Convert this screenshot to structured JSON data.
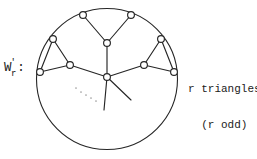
{
  "figure": {
    "name": "W-prime-r-wheel-graph",
    "left_label": {
      "base": "W",
      "prime": "'",
      "subscript": "r",
      "colon": ":"
    },
    "right_label": {
      "line1": "r triangles",
      "line2": "(r odd)"
    },
    "ellipsis": "...",
    "colors": {
      "ink": "#1b1b1b",
      "stroke": "#262626",
      "node_fill": "#ffffff",
      "background": "#ffffff",
      "faint_ink": "#9a9a9a"
    },
    "geometry": {
      "circle": {
        "cx": 107,
        "cy": 79,
        "r": 70.5
      },
      "hub": {
        "x": 107,
        "y": 77
      },
      "stroke_width": 1.1,
      "node_radius": 3.4
    },
    "nodes": [
      {
        "id": "rim-top-left",
        "x": 83,
        "y": 15,
        "on_circle": true
      },
      {
        "id": "rim-top-right",
        "x": 131,
        "y": 15,
        "on_circle": true
      },
      {
        "id": "rim-upper-left",
        "x": 53,
        "y": 39,
        "on_circle": true
      },
      {
        "id": "rim-upper-right",
        "x": 161,
        "y": 39,
        "on_circle": true
      },
      {
        "id": "rim-lower-left",
        "x": 40,
        "y": 72,
        "on_circle": true
      },
      {
        "id": "rim-lower-right",
        "x": 174,
        "y": 72,
        "on_circle": true
      },
      {
        "id": "apex-top",
        "x": 107,
        "y": 43,
        "on_circle": false
      },
      {
        "id": "apex-left",
        "x": 70,
        "y": 65,
        "on_circle": false
      },
      {
        "id": "apex-right",
        "x": 144,
        "y": 65,
        "on_circle": false
      },
      {
        "id": "hub-center",
        "x": 107,
        "y": 77,
        "on_circle": false
      }
    ],
    "edges": [
      {
        "from": "rim-top-left",
        "to": "apex-top"
      },
      {
        "from": "rim-top-right",
        "to": "apex-top"
      },
      {
        "from": "apex-top",
        "to": "hub-center"
      },
      {
        "from": "rim-upper-left",
        "to": "apex-left"
      },
      {
        "from": "rim-lower-left",
        "to": "apex-left"
      },
      {
        "from": "rim-upper-left",
        "to": "rim-lower-left"
      },
      {
        "from": "apex-left",
        "to": "hub-center"
      },
      {
        "from": "rim-upper-right",
        "to": "apex-right"
      },
      {
        "from": "rim-lower-right",
        "to": "apex-right"
      },
      {
        "from": "rim-upper-right",
        "to": "rim-lower-right"
      },
      {
        "from": "apex-right",
        "to": "hub-center"
      }
    ],
    "stub_edges": [
      {
        "from": "hub-center",
        "to_x": 104,
        "to_y": 110
      },
      {
        "from": "hub-center",
        "to_x": 131,
        "to_y": 100
      }
    ]
  }
}
